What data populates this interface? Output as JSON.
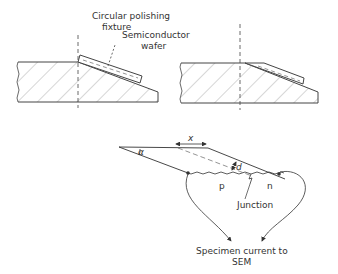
{
  "figure": {
    "top_left": {
      "label_fixture_line1": "Circular polishing",
      "label_fixture_line2": "fixture",
      "label_wafer_line1": "Semiconductor",
      "label_wafer_line2": "wafer"
    },
    "bottom": {
      "label_alpha": "α",
      "label_x": "x",
      "label_d": "d",
      "label_p": "p",
      "label_n": "n",
      "label_junction": "Junction",
      "label_output_line1": "Specimen current to",
      "label_output_line2": "SEM"
    },
    "colors": {
      "line": "#333333",
      "hatch": "#888888",
      "background": "#ffffff"
    }
  }
}
